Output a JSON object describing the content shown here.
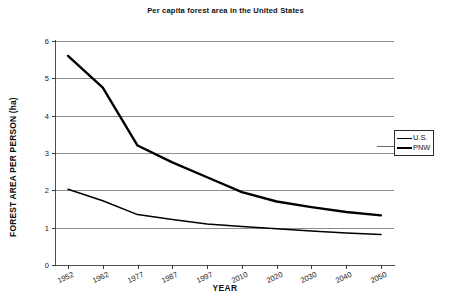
{
  "chart_data": {
    "type": "line",
    "title": "Per capita forest area in the United States",
    "xlabel": "YEAR",
    "ylabel": "FOREST AREA PER PERSON (ha)",
    "categories": [
      "1952",
      "1962",
      "1977",
      "1987",
      "1997",
      "2010",
      "2020",
      "2030",
      "2040",
      "2050"
    ],
    "x": [
      1952,
      1962,
      1977,
      1987,
      1997,
      2010,
      2020,
      2030,
      2040,
      2050
    ],
    "series": [
      {
        "name": "PNW",
        "style": "thick",
        "values": [
          5.6,
          4.75,
          3.2,
          2.75,
          2.35,
          1.95,
          1.7,
          1.55,
          1.42,
          1.33
        ]
      },
      {
        "name": "U.S.",
        "style": "thin",
        "values": [
          2.03,
          1.72,
          1.35,
          1.22,
          1.1,
          1.03,
          0.97,
          0.91,
          0.86,
          0.82
        ]
      }
    ],
    "ylim": [
      0,
      6
    ],
    "yticks": [
      0,
      1,
      2,
      3,
      4,
      5,
      6
    ],
    "ytick_labels": [
      "0",
      "1",
      "2",
      "3",
      "4",
      "5",
      "6"
    ],
    "grid": "horizontal",
    "grid_color": "#8d8d8d",
    "line_color": "#000000",
    "legend_position": "right-outside",
    "legend_entries": [
      {
        "label": "U.S.",
        "style": "thin"
      },
      {
        "label": "PNW",
        "style": "thick"
      }
    ]
  }
}
